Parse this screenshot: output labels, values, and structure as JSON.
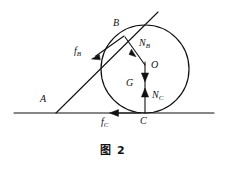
{
  "figure": {
    "caption": "图 2",
    "background_color": "#ffffff",
    "stroke_color": "#111111"
  },
  "labels": {
    "point_a": {
      "text": "A",
      "sub": ""
    },
    "point_b": {
      "text": "B",
      "sub": ""
    },
    "point_c": {
      "text": "C",
      "sub": ""
    },
    "center_o": {
      "text": "O",
      "sub": ""
    },
    "force_fb": {
      "text": "f",
      "sub": "B"
    },
    "force_fc": {
      "text": "f",
      "sub": "C"
    },
    "force_nb": {
      "text": "N",
      "sub": "B"
    },
    "force_nc": {
      "text": "N",
      "sub": "C"
    },
    "force_g": {
      "text": "G",
      "sub": ""
    }
  },
  "geometry": {
    "ground_line": {
      "x1": 14,
      "y1": 113,
      "x2": 214,
      "y2": 113
    },
    "incline_line": {
      "x1": 56,
      "y1": 113,
      "x2": 158,
      "y2": 12
    },
    "circle": {
      "cx": 145,
      "cy": 69,
      "r": 44
    },
    "point_a": {
      "x": 56,
      "y": 113
    },
    "point_b": {
      "x": 124,
      "y": 35
    },
    "point_c": {
      "x": 145,
      "y": 113
    },
    "center_o": {
      "x": 145,
      "y": 69
    }
  },
  "vectors": [
    {
      "name": "f_B",
      "from": [
        124,
        36
      ],
      "to": [
        92,
        58
      ],
      "direction": "down-left along incline"
    },
    {
      "name": "N_B",
      "from": [
        124,
        36
      ],
      "to": [
        145,
        65
      ],
      "direction": "toward center O"
    },
    {
      "name": "G",
      "from": [
        145,
        64
      ],
      "to": [
        145,
        81
      ],
      "direction": "down"
    },
    {
      "name": "N_C",
      "from": [
        145,
        113
      ],
      "to": [
        145,
        89
      ],
      "direction": "up"
    },
    {
      "name": "f_C",
      "from": [
        136,
        113
      ],
      "to": [
        110,
        113
      ],
      "direction": "left along ground"
    }
  ]
}
